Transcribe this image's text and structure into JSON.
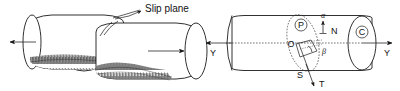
{
  "figure": {
    "caption_left": "Slip plane",
    "panels": [
      {
        "id": "left",
        "name": "shear-fracture-illustration",
        "description": "Two cylindrical halves displaced along an inclined slip plane with shaded fracture surfaces and opposing tensile arrows",
        "labels": [
          {
            "key": "slip_plane",
            "text": "Slip plane"
          }
        ]
      },
      {
        "id": "right",
        "name": "stress-resolution-diagram",
        "description": "Cylinder with inclined slip plane ellipse, normal N, shear direction S, applied load axis Y-Y and angles alpha and beta",
        "labels": [
          {
            "key": "axis_left",
            "text": "Y"
          },
          {
            "key": "axis_right",
            "text": "Y"
          },
          {
            "key": "origin",
            "text": "O"
          },
          {
            "key": "slip_plane_circle",
            "text": "P"
          },
          {
            "key": "cross_section_circle",
            "text": "C"
          },
          {
            "key": "normal",
            "text": "N"
          },
          {
            "key": "shear_point",
            "text": "S"
          },
          {
            "key": "force",
            "text": "T"
          },
          {
            "key": "alpha",
            "text": "α"
          },
          {
            "key": "beta",
            "text": "β"
          }
        ]
      }
    ]
  },
  "colors": {
    "ink": "#1a1a1a",
    "background": "#ffffff",
    "dotted": "#3a3a3a"
  }
}
